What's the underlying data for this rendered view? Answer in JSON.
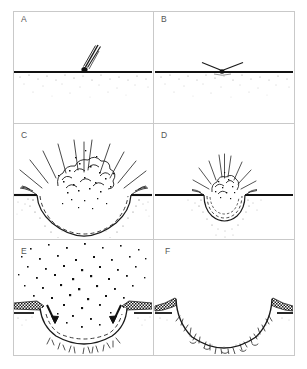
{
  "figure": {
    "caption": "",
    "background_color": "#ffffff",
    "ink_color": "#1a1a1a",
    "frame_color": "#c8c8c8",
    "label_color": "#555555",
    "width_px": 307,
    "height_px": 369,
    "layout": {
      "columns": 2,
      "rows": 3,
      "frame": {
        "x": 13,
        "y": 11,
        "width": 281,
        "height": 344
      },
      "column_divider_x": 153,
      "row_divider_y": [
        123,
        239
      ]
    }
  },
  "panels": [
    {
      "id": "A",
      "label": "A",
      "label_x": 22,
      "label_y": 19,
      "stage": "approach",
      "description": "Oblique impactor descending toward a flat stippled surface with motion streak trail",
      "surface_y": 72,
      "features": {
        "impactor_body_x": 84,
        "impactor_body_y": 70,
        "trail_lines": 3,
        "trail_angle_deg": 57,
        "crater": false,
        "plume": false
      }
    },
    {
      "id": "B",
      "label": "B",
      "label_x": 162,
      "label_y": 19,
      "stage": "contact-and-compression",
      "description": "Impactor at surface contact producing two low-angle jets along the surface",
      "surface_y": 72,
      "features": {
        "impactor_body_x": 222,
        "impactor_body_y": 72,
        "jet_lines": 2,
        "crater": false,
        "plume": false
      }
    },
    {
      "id": "C",
      "label": "C",
      "label_x": 22,
      "label_y": 135,
      "stage": "excavation-large",
      "description": "Growing transient bowl-shaped cavity with overturned rim flaps, radiating ejecta rays and a billowing dotted ejecta plume",
      "surface_y": 195,
      "features": {
        "crater": true,
        "crater_center_x": 84,
        "crater_half_width": 47,
        "crater_depth": 36,
        "dashed_inner_boundary": true,
        "ray_lines": 11,
        "plume": true,
        "plume_dots": 34,
        "overturned_rim_flaps": 2
      }
    },
    {
      "id": "D",
      "label": "D",
      "label_x": 162,
      "label_y": 135,
      "stage": "excavation-small",
      "description": "Smaller-scale transient cavity with concentric dashed arcs and a compact ejecta plume with short rays",
      "surface_y": 195,
      "features": {
        "crater": true,
        "crater_center_x": 224,
        "crater_half_width": 22,
        "crater_depth": 22,
        "dashed_inner_boundary": true,
        "ray_lines": 9,
        "plume": true,
        "plume_dots": 16,
        "overturned_rim_flaps": 2
      }
    },
    {
      "id": "E",
      "label": "E",
      "label_x": 22,
      "label_y": 251,
      "stage": "modification-collapse",
      "description": "Ejecta fallback as dense scattered debris, inward-pointing collapse arrows, hatched ejecta blanket draping the raised rim and fractured floor beneath",
      "surface_y": 310,
      "features": {
        "crater": true,
        "crater_center_x": 84,
        "crater_half_width": 47,
        "crater_depth": 34,
        "dashed_inner_boundary": true,
        "collapse_arrows": 2,
        "falling_debris_dots": 96,
        "hatched_ejecta_blanket": true,
        "breccia_marks": 14,
        "plume": false
      }
    },
    {
      "id": "F",
      "label": "F",
      "label_x": 166,
      "label_y": 251,
      "stage": "final-crater",
      "description": "Final bowl-shaped crater with raised hatched ejecta-blanket rims and a breccia lens of fragments lining the floor",
      "surface_y": 310,
      "features": {
        "crater": true,
        "crater_center_x": 224,
        "crater_half_width": 55,
        "crater_depth": 34,
        "dashed_inner_boundary": false,
        "collapse_arrows": 0,
        "falling_debris_dots": 0,
        "hatched_ejecta_blanket": true,
        "breccia_marks": 30,
        "plume": false
      }
    }
  ]
}
